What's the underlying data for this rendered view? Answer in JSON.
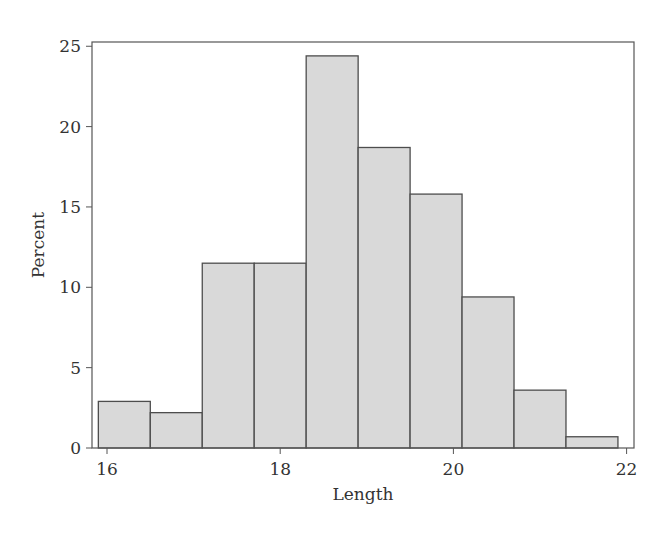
{
  "chart_data": {
    "type": "bar",
    "subtype": "histogram",
    "title": "",
    "xlabel": "Length",
    "ylabel": "Percent",
    "xlim": [
      15.9,
      22.1
    ],
    "ylim": [
      0,
      25
    ],
    "xticks": [
      16,
      18,
      20,
      22
    ],
    "yticks": [
      0,
      5,
      10,
      15,
      20,
      25
    ],
    "grid": false,
    "legend": null,
    "bin_width": 0.6,
    "bins": [
      {
        "start": 15.9,
        "end": 16.5,
        "value": 2.9
      },
      {
        "start": 16.5,
        "end": 17.1,
        "value": 2.2
      },
      {
        "start": 17.1,
        "end": 17.7,
        "value": 11.5
      },
      {
        "start": 17.7,
        "end": 18.3,
        "value": 11.5
      },
      {
        "start": 18.3,
        "end": 18.9,
        "value": 24.4
      },
      {
        "start": 18.9,
        "end": 19.5,
        "value": 18.7
      },
      {
        "start": 19.5,
        "end": 20.1,
        "value": 15.8
      },
      {
        "start": 20.1,
        "end": 20.7,
        "value": 9.4
      },
      {
        "start": 20.7,
        "end": 21.3,
        "value": 3.6
      },
      {
        "start": 21.3,
        "end": 21.9,
        "value": 0.7
      }
    ],
    "categories": [
      "16.2",
      "16.8",
      "17.4",
      "18.0",
      "18.6",
      "19.2",
      "19.8",
      "20.4",
      "21.0",
      "21.6"
    ],
    "values": [
      2.9,
      2.2,
      11.5,
      11.5,
      24.4,
      18.7,
      15.8,
      9.4,
      3.6,
      0.7
    ],
    "colors": {
      "bar_fill": "#d9d9d9",
      "bar_stroke": "#4d4d4d",
      "axis": "#555555",
      "text": "#333333"
    }
  }
}
